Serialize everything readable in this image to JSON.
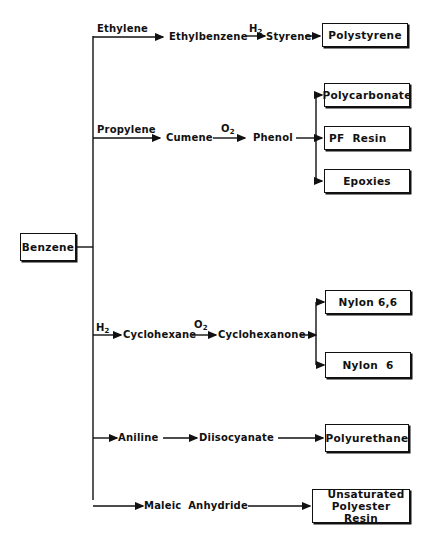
{
  "diagram": {
    "root": "Benzene",
    "branches": {
      "ethylene": {
        "reagent": "Ethylene",
        "intermediate": "Ethylbenzene",
        "step_reagent": "H",
        "step_reagent_sub": "2",
        "intermediate2": "Styrene",
        "product": "Polystyrene"
      },
      "propylene": {
        "reagent": "Propylene",
        "intermediate": "Cumene",
        "step_reagent": "O",
        "step_reagent_sub": "2",
        "intermediate2": "Phenol",
        "products": [
          "Polycarbonate",
          "PF Resin",
          "Epoxies"
        ]
      },
      "hydrogen": {
        "reagent": "H",
        "reagent_sub": "2",
        "intermediate": "Cyclohexane",
        "step_reagent": "O",
        "step_reagent_sub": "2",
        "intermediate2": "Cyclohexanone",
        "products": [
          "Nylon 6,6",
          "Nylon 6"
        ]
      },
      "aniline": {
        "intermediate": "Aniline",
        "intermediate2": "Diisocyanate",
        "product": "Polyurethane"
      },
      "maleic": {
        "intermediate": "Maleic Anhydride",
        "product_line1": "Unsaturated",
        "product_line2": "Polyester Resin"
      }
    }
  }
}
